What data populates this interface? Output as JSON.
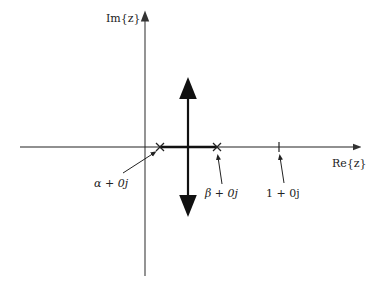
{
  "diagram": {
    "type": "root-locus",
    "axes": {
      "imag_label": "Im{z}",
      "real_label": "Re{z}"
    },
    "poles": [
      {
        "label": "α + 0j",
        "marker": "x"
      },
      {
        "label": "β + 0j",
        "marker": "x"
      }
    ],
    "reference_point": {
      "label": "1 + 0j",
      "marker": "tick"
    },
    "colors": {
      "axis": "#666666",
      "locus": "#111111",
      "background": "#ffffff"
    }
  }
}
